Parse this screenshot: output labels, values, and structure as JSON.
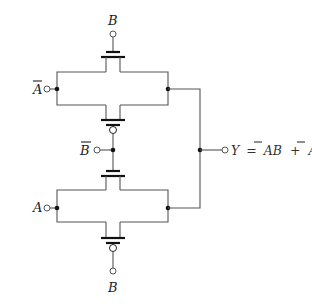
{
  "diagram": {
    "type": "cmos-transmission-gate-xor",
    "labels": {
      "top_gate": "B",
      "left_top_input": "A",
      "left_top_input_overbar": true,
      "middle_input": "B",
      "middle_input_overbar": true,
      "left_bottom_input": "A",
      "bottom_gate": "B",
      "output_lhs": "Y",
      "output_eq": "=",
      "output_term1": "AB",
      "output_term1_overbar_on": "A",
      "output_plus": "+",
      "output_term2": "AB",
      "output_term2_overbar_on": "B"
    },
    "components": [
      {
        "id": "t1",
        "kind": "nmos",
        "gate": "B",
        "position": "top"
      },
      {
        "id": "t2",
        "kind": "pmos",
        "gate": "B-bar",
        "position": "upper-middle"
      },
      {
        "id": "t3",
        "kind": "nmos",
        "gate": "B-bar",
        "position": "lower-middle"
      },
      {
        "id": "t4",
        "kind": "pmos",
        "gate": "B",
        "position": "bottom"
      }
    ],
    "colors": {
      "wire": "#555555",
      "terminal": "#111111",
      "background": "#ffffff"
    }
  }
}
